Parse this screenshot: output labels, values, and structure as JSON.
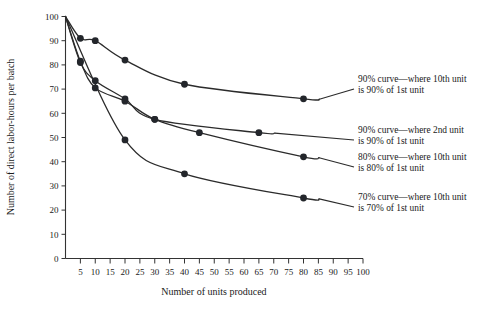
{
  "chart_data": {
    "type": "line",
    "title": "",
    "xlabel": "Number of units produced",
    "ylabel": "Number of direct labor-hours per batch",
    "xlim": [
      0,
      100
    ],
    "ylim": [
      0,
      100
    ],
    "grid": false,
    "legend_position": "right-annotations",
    "xticks": [
      5,
      10,
      15,
      20,
      25,
      30,
      35,
      40,
      45,
      50,
      55,
      60,
      65,
      70,
      75,
      80,
      85,
      90,
      95,
      100
    ],
    "yticks": [
      0,
      10,
      20,
      30,
      40,
      50,
      60,
      70,
      80,
      90,
      100
    ],
    "series": [
      {
        "name": "90% curve—where 10th unit is 90% of 1st unit",
        "label_line1": "90% curve—where 10th unit",
        "label_line2": "is 90% of 1st unit",
        "x": [
          0,
          5,
          10,
          20,
          40,
          80
        ],
        "values": [
          100,
          91,
          90,
          82,
          72,
          66
        ]
      },
      {
        "name": "90% curve—where 2nd unit is 90% of 1st unit",
        "label_line1": "90% curve—where 2nd unit",
        "label_line2": "is 90% of 1st unit",
        "x": [
          0,
          5,
          10,
          20,
          30,
          65
        ],
        "values": [
          100,
          81,
          73.5,
          66,
          57.5,
          52
        ]
      },
      {
        "name": "80% curve—where 10th unit is 80% of 1st unit",
        "label_line1": "80% curve—where 10th unit",
        "label_line2": "is 80% of 1st unit",
        "x": [
          0,
          5,
          10,
          20,
          30,
          45,
          80
        ],
        "values": [
          100,
          81.5,
          70.5,
          65,
          57.5,
          52,
          42
        ]
      },
      {
        "name": "70% curve—where 10th unit is 70% of 1st unit",
        "label_line1": "70% curve—where 10th unit",
        "label_line2": "is 70% of 1st unit",
        "x": [
          0,
          20,
          40,
          80
        ],
        "values": [
          100,
          49,
          35,
          25
        ]
      }
    ],
    "colors": {
      "curve": "#2b2b2b",
      "marker": "#23262b",
      "axis": "#333333",
      "text": "#1a1a1a",
      "background": "#ffffff"
    }
  }
}
